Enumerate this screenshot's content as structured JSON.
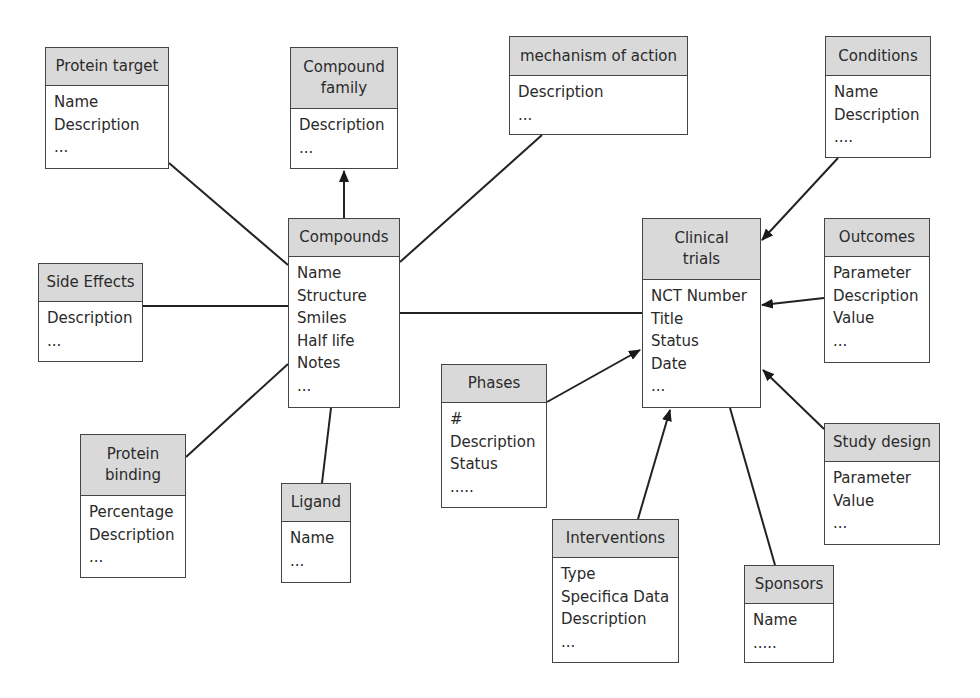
{
  "entities": {
    "protein_target": {
      "title": "Protein target",
      "attributes": [
        "Name",
        "Description",
        "..."
      ]
    },
    "compound_family": {
      "title": "Compound family",
      "attributes": [
        "Description",
        "..."
      ]
    },
    "mechanism_of_action": {
      "title": "mechanism of action",
      "attributes": [
        "Description",
        "..."
      ]
    },
    "conditions": {
      "title": "Conditions",
      "attributes": [
        "Name",
        "Description",
        "...."
      ]
    },
    "side_effects": {
      "title": "Side Effects",
      "attributes": [
        "Description",
        "..."
      ]
    },
    "compounds": {
      "title": "Compounds",
      "attributes": [
        "Name",
        "Structure",
        "Smiles",
        "Half life",
        "Notes",
        "..."
      ]
    },
    "clinical_trials": {
      "title": "Clinical trials",
      "attributes": [
        "NCT Number",
        "Title",
        "Status",
        "Date",
        "..."
      ]
    },
    "outcomes": {
      "title": "Outcomes",
      "attributes": [
        "Parameter",
        "Description",
        "Value",
        "..."
      ]
    },
    "phases": {
      "title": "Phases",
      "attributes": [
        "#",
        "Description",
        "Status",
        "....."
      ]
    },
    "study_design": {
      "title": "Study design",
      "attributes": [
        "Parameter",
        "Value",
        "..."
      ]
    },
    "protein_binding": {
      "title": "Protein binding",
      "attributes": [
        "Percentage",
        "Description",
        "..."
      ]
    },
    "ligand": {
      "title": "Ligand",
      "attributes": [
        "Name",
        "..."
      ]
    },
    "interventions": {
      "title": "Interventions",
      "attributes": [
        "Type",
        "Specifica Data",
        "Description",
        "..."
      ]
    },
    "sponsors": {
      "title": "Sponsors",
      "attributes": [
        "Name",
        "....."
      ]
    }
  },
  "relationships": [
    {
      "from": "compounds",
      "to": "protein_target",
      "arrow": false
    },
    {
      "from": "compounds",
      "to": "compound_family",
      "arrow": true
    },
    {
      "from": "compounds",
      "to": "mechanism_of_action",
      "arrow": false
    },
    {
      "from": "compounds",
      "to": "side_effects",
      "arrow": false
    },
    {
      "from": "compounds",
      "to": "protein_binding",
      "arrow": false
    },
    {
      "from": "compounds",
      "to": "ligand",
      "arrow": false
    },
    {
      "from": "compounds",
      "to": "clinical_trials",
      "arrow": false
    },
    {
      "from": "conditions",
      "to": "clinical_trials",
      "arrow": true
    },
    {
      "from": "outcomes",
      "to": "clinical_trials",
      "arrow": true
    },
    {
      "from": "phases",
      "to": "clinical_trials",
      "arrow": true
    },
    {
      "from": "study_design",
      "to": "clinical_trials",
      "arrow": true
    },
    {
      "from": "interventions",
      "to": "clinical_trials",
      "arrow": true
    },
    {
      "from": "sponsors",
      "to": "clinical_trials",
      "arrow": false
    }
  ],
  "colors": {
    "header_fill": "#d9d9d9",
    "border": "#444444",
    "line": "#222222"
  }
}
